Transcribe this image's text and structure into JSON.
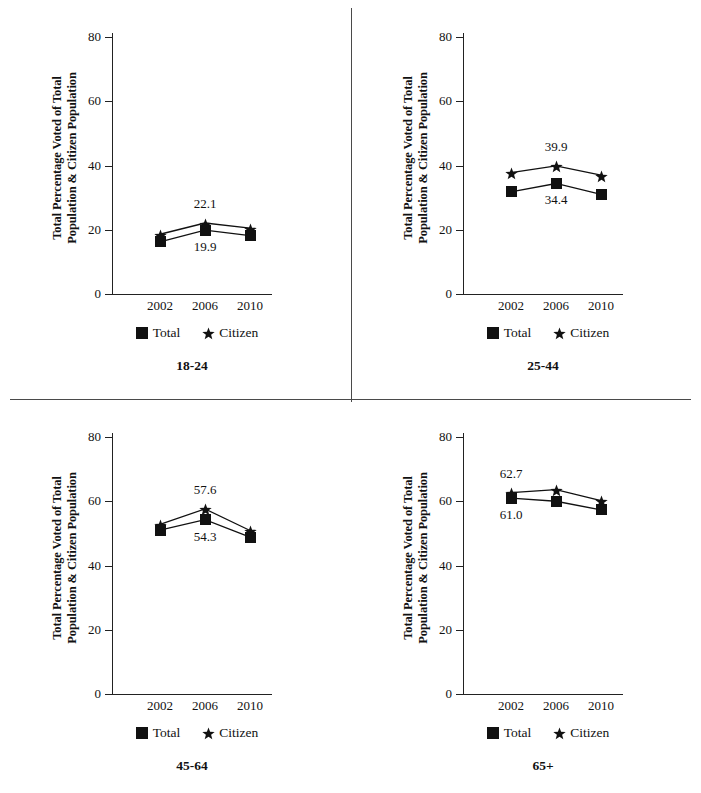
{
  "figure": {
    "width": 701,
    "height": 793,
    "background": "#ffffff",
    "ink_color": "#111111",
    "divider_color": "#4a4a4a"
  },
  "axis": {
    "ylabel_line1": "Total Percentage Voted of Total",
    "ylabel_line2": "Population & Citizen Population",
    "yticks": [
      0,
      20,
      40,
      60,
      80
    ],
    "ytick_labels": [
      "0",
      "20",
      "40",
      "60",
      "80"
    ],
    "ylim": [
      0,
      80
    ],
    "xticks": [
      "2002",
      "2006",
      "2010"
    ]
  },
  "legend": {
    "position": "below-axis",
    "items": [
      {
        "label": "Total",
        "marker": "square-marker"
      },
      {
        "label": "Citizen",
        "marker": "star-marker"
      }
    ]
  },
  "chart_data": [
    {
      "type": "line",
      "title": "18-24",
      "xlabel": "",
      "ylabel": "Total Percentage Voted of Total Population & Citizen Population",
      "categories": [
        "2002",
        "2006",
        "2010"
      ],
      "ylim": [
        0,
        80
      ],
      "grid": false,
      "series": [
        {
          "name": "Total",
          "marker": "square-marker",
          "values": [
            16.2,
            19.9,
            18.2
          ]
        },
        {
          "name": "Citizen",
          "marker": "star-marker",
          "values": [
            18.6,
            22.1,
            20.5
          ]
        }
      ],
      "annotations": [
        {
          "text": "22.1",
          "series": "Citizen",
          "category": "2006",
          "placement": "above"
        },
        {
          "text": "19.9",
          "series": "Total",
          "category": "2006",
          "placement": "below"
        }
      ]
    },
    {
      "type": "line",
      "title": "25-44",
      "xlabel": "",
      "ylabel": "Total Percentage Voted of Total Population & Citizen Population",
      "categories": [
        "2002",
        "2006",
        "2010"
      ],
      "ylim": [
        0,
        80
      ],
      "grid": false,
      "series": [
        {
          "name": "Total",
          "marker": "square-marker",
          "values": [
            31.8,
            34.4,
            31.0
          ]
        },
        {
          "name": "Citizen",
          "marker": "star-marker",
          "values": [
            37.8,
            39.9,
            37.0
          ]
        }
      ],
      "annotations": [
        {
          "text": "39.9",
          "series": "Citizen",
          "category": "2006",
          "placement": "above"
        },
        {
          "text": "34.4",
          "series": "Total",
          "category": "2006",
          "placement": "below"
        }
      ]
    },
    {
      "type": "line",
      "title": "45-64",
      "xlabel": "",
      "ylabel": "Total Percentage Voted of Total Population & Citizen Population",
      "categories": [
        "2002",
        "2006",
        "2010"
      ],
      "ylim": [
        0,
        80
      ],
      "grid": false,
      "series": [
        {
          "name": "Total",
          "marker": "square-marker",
          "values": [
            51.0,
            54.3,
            48.8
          ]
        },
        {
          "name": "Citizen",
          "marker": "star-marker",
          "values": [
            52.8,
            57.6,
            50.9
          ]
        }
      ],
      "annotations": [
        {
          "text": "57.6",
          "series": "Citizen",
          "category": "2006",
          "placement": "above"
        },
        {
          "text": "54.3",
          "series": "Total",
          "category": "2006",
          "placement": "below"
        }
      ]
    },
    {
      "type": "line",
      "title": "65+",
      "xlabel": "",
      "ylabel": "Total Percentage Voted of Total Population & Citizen Population",
      "categories": [
        "2002",
        "2006",
        "2010"
      ],
      "ylim": [
        0,
        80
      ],
      "grid": false,
      "series": [
        {
          "name": "Total",
          "marker": "square-marker",
          "values": [
            61.0,
            60.0,
            57.3
          ]
        },
        {
          "name": "Citizen",
          "marker": "star-marker",
          "values": [
            62.7,
            63.6,
            60.2
          ]
        }
      ],
      "annotations": [
        {
          "text": "62.7",
          "series": "Citizen",
          "category": "2002",
          "placement": "above"
        },
        {
          "text": "61.0",
          "series": "Total",
          "category": "2002",
          "placement": "below"
        }
      ]
    }
  ]
}
